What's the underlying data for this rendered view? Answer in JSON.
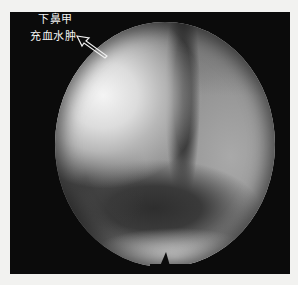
{
  "image": {
    "type": "nasal endoscopy photograph",
    "annotation": {
      "line1": "下鼻甲",
      "line2": "充血水肿",
      "arrow": "outline-arrow"
    },
    "colors": {
      "frame": "#0b0b0b",
      "page_background": "#f2f2f0",
      "label_text": "#f4f4f4"
    }
  }
}
